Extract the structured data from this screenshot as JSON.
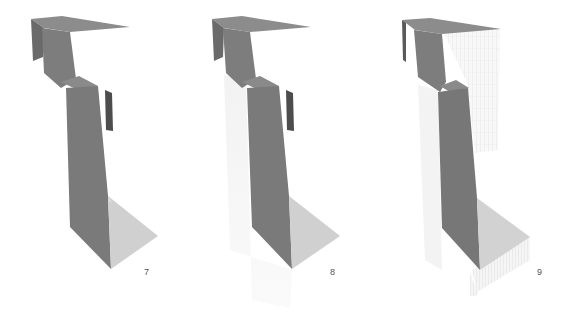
{
  "figures": [
    {
      "number": "7",
      "label": "Sheet model rendering"
    },
    {
      "number": "8",
      "label": "Sheet model rendering with ghost volume"
    },
    {
      "number": "9",
      "label": "Sheet model rendering with gridded volume"
    }
  ],
  "colors": {
    "background": "#ffffff",
    "panel_dark": "#6e6e6e",
    "panel_mid": "#858585",
    "panel_top": "#8f8f8f",
    "panel_light": "#d2d2d2",
    "panel_darkest": "#4a4a4a",
    "ghost": "#f0f0f0",
    "grid": "#d8d8d8"
  }
}
